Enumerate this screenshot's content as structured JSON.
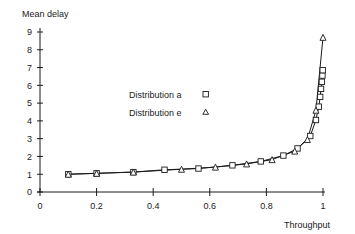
{
  "chart_data": {
    "type": "line",
    "title": "",
    "ylabel": "Mean delay",
    "xlabel": "Throughput",
    "xlim": [
      0,
      1
    ],
    "ylim": [
      0,
      9
    ],
    "grid": false,
    "legend_position": "center",
    "xticks": [
      0,
      0.2,
      0.4,
      0.6,
      0.8,
      1
    ],
    "xtick_labels": [
      "0",
      "0.2",
      "0.4",
      "0.6",
      "0.8",
      "1"
    ],
    "yticks": [
      0,
      1,
      2,
      3,
      4,
      5,
      6,
      7,
      8,
      9
    ],
    "ytick_labels": [
      "0",
      "1",
      "2",
      "3",
      "4",
      "5",
      "6",
      "7",
      "8",
      "9"
    ],
    "series": [
      {
        "name": "Distribution a",
        "marker": "square",
        "x": [
          0.1,
          0.2,
          0.33,
          0.44,
          0.56,
          0.68,
          0.78,
          0.86,
          0.91,
          0.955,
          0.975,
          0.985,
          0.99,
          0.993,
          0.996,
          0.998,
          0.999
        ],
        "y": [
          1.0,
          1.05,
          1.12,
          1.25,
          1.32,
          1.5,
          1.72,
          2.05,
          2.45,
          3.15,
          4.05,
          4.8,
          5.35,
          5.8,
          6.2,
          6.55,
          6.85
        ]
      },
      {
        "name": "Distribution e",
        "marker": "triangle",
        "x": [
          0.1,
          0.2,
          0.33,
          0.5,
          0.62,
          0.73,
          0.82,
          0.9,
          0.945,
          0.975,
          1.0
        ],
        "y": [
          1.0,
          1.05,
          1.12,
          1.28,
          1.4,
          1.58,
          1.82,
          2.3,
          2.95,
          4.6,
          8.7
        ]
      }
    ]
  },
  "legend": {
    "entries": [
      {
        "label": "Distribution a",
        "marker": "square-marker"
      },
      {
        "label": "Distribution e",
        "marker": "triangle-marker"
      }
    ]
  },
  "colors": {
    "ink": "#1a1a1a",
    "background": "#ffffff",
    "marker_fill": "#ffffff"
  }
}
